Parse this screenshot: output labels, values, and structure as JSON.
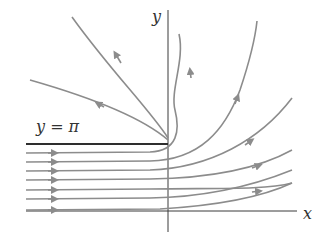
{
  "diagram": {
    "type": "phase-portrait / solution curves",
    "axes": {
      "x_label": "x",
      "y_label": "y"
    },
    "annotation": "y = π",
    "colors": {
      "axis": "#3a3a3a",
      "boundary_line": "#2e2e2e",
      "curves": "#8c8c8c",
      "background": "#ffffff"
    },
    "curves": [
      {
        "id": "upper-left-1",
        "direction": "toward upper-left"
      },
      {
        "id": "upper-left-2",
        "direction": "toward upper-left"
      },
      {
        "id": "turn-up-1",
        "direction": "rightward then upward"
      },
      {
        "id": "turn-up-2",
        "direction": "rightward then upward"
      },
      {
        "id": "fan-1",
        "direction": "rightward then up-right"
      },
      {
        "id": "fan-2",
        "direction": "rightward then up-right"
      },
      {
        "id": "fan-3",
        "direction": "rightward then up-right"
      },
      {
        "id": "fan-4",
        "direction": "rightward then up-right"
      }
    ]
  }
}
